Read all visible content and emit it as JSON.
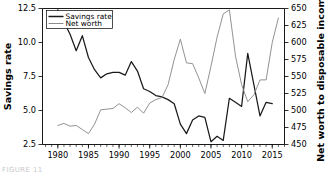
{
  "figure": {
    "caption_fragment": "FIGURE 11",
    "background_color": "#ffffff"
  },
  "legend": {
    "position": "upper-left-inside",
    "entries": [
      {
        "label": "Savings rate",
        "color": "#1a1a1a",
        "width": 1.3
      },
      {
        "label": "Net worth",
        "color": "#8c8c8c",
        "width": 1.0
      }
    ]
  },
  "chart_data": {
    "type": "line",
    "title": "",
    "subtitle": "",
    "xlabel": "",
    "ylabel": "Savings rate",
    "y2label": "Net worth to disposable income",
    "xlim": [
      1977.5,
      2017.0
    ],
    "ylim": [
      2.5,
      12.5
    ],
    "y2lim": [
      450,
      650
    ],
    "grid": false,
    "legend_position": "upper left",
    "xticks": [
      1980,
      1985,
      1990,
      1995,
      2000,
      2005,
      2010,
      2015
    ],
    "xtick_labels": [
      "1980",
      "1985",
      "1990",
      "1995",
      "2000",
      "2005",
      "2010",
      "2015"
    ],
    "x_minor_tick_step": 1,
    "yticks": [
      2.5,
      5.0,
      7.5,
      10.0,
      12.5
    ],
    "ytick_labels": [
      "2.5",
      "5.0",
      "7.5",
      "10.0",
      "12.5"
    ],
    "y2ticks": [
      450,
      475,
      500,
      525,
      550,
      575,
      600,
      625,
      650
    ],
    "y2tick_labels": [
      "450",
      "475",
      "500",
      "525",
      "550",
      "575",
      "600",
      "625",
      "650"
    ],
    "x": [
      1980,
      1981,
      1982,
      1983,
      1984,
      1985,
      1986,
      1987,
      1988,
      1989,
      1990,
      1991,
      1992,
      1993,
      1994,
      1995,
      1996,
      1997,
      1998,
      1999,
      2000,
      2001,
      2002,
      2003,
      2004,
      2005,
      2006,
      2007,
      2008,
      2009,
      2010,
      2011,
      2012,
      2013,
      2014,
      2015,
      2016
    ],
    "series": [
      {
        "name": "Savings rate",
        "axis": "left",
        "color": "#1a1a1a",
        "units": "percent of disposable income",
        "x": [
          1980,
          1981,
          1982,
          1983,
          1984,
          1985,
          1986,
          1987,
          1988,
          1989,
          1990,
          1991,
          1992,
          1993,
          1994,
          1995,
          1996,
          1997,
          1998,
          1999,
          2000,
          2001,
          2002,
          2003,
          2004,
          2005,
          2006,
          2007,
          2008,
          2009,
          2010,
          2011,
          2012,
          2013,
          2014,
          2015
        ],
        "values": [
          12.4,
          11.5,
          10.6,
          9.4,
          10.5,
          8.9,
          8.0,
          7.4,
          7.7,
          7.8,
          7.8,
          7.6,
          8.6,
          7.9,
          6.6,
          6.4,
          6.1,
          6.0,
          5.8,
          5.5,
          4.0,
          3.3,
          4.3,
          4.6,
          4.5,
          2.7,
          3.1,
          2.8,
          5.9,
          5.6,
          5.3,
          9.2,
          6.9,
          4.6,
          5.6,
          5.5
        ]
      },
      {
        "name": "Net worth",
        "axis": "right",
        "color": "#8c8c8c",
        "units": "ratio to disposable income (percent)",
        "x": [
          1980,
          1981,
          1982,
          1983,
          1984,
          1985,
          1986,
          1987,
          1988,
          1989,
          1990,
          1991,
          1992,
          1993,
          1994,
          1995,
          1996,
          1997,
          1998,
          1999,
          2000,
          2001,
          2002,
          2003,
          2004,
          2005,
          2006,
          2007,
          2008,
          2009,
          2010,
          2011,
          2012,
          2013,
          2014,
          2015,
          2016
        ],
        "values": [
          478,
          481,
          477,
          478,
          472,
          466,
          480,
          501,
          502,
          503,
          510,
          504,
          497,
          505,
          496,
          511,
          516,
          519,
          538,
          575,
          605,
          570,
          569,
          548,
          525,
          565,
          608,
          642,
          648,
          580,
          538,
          513,
          523,
          545,
          545,
          600,
          636
        ]
      }
    ],
    "annotations": []
  }
}
